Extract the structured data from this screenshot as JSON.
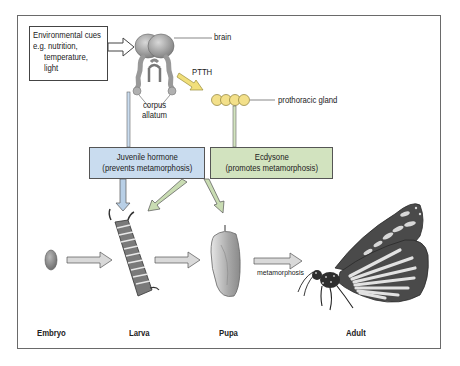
{
  "diagram": {
    "environment_box": {
      "lines": [
        "Environmental cues",
        "e.g. nutrition,",
        "temperature,",
        "light"
      ]
    },
    "labels": {
      "brain": "brain",
      "ptth": "PTTH",
      "prothoracic_gland": "prothoracic gland",
      "corpus_allatum_1": "corpus",
      "corpus_allatum_2": "allatum",
      "metamorphosis": "metamorphosis"
    },
    "hormones": {
      "juvenile": {
        "title": "Juvenile hormone",
        "subtitle": "(prevents metamorphosis)",
        "color": "#c9dcef"
      },
      "ecdysone": {
        "title": "Ecdysone",
        "subtitle": "(promotes metamorphosis)",
        "color": "#d2e3bf"
      }
    },
    "stages": [
      {
        "label": "Embryo"
      },
      {
        "label": "Larva"
      },
      {
        "label": "Pupa"
      },
      {
        "label": "Adult"
      }
    ],
    "colors": {
      "gland_fill": "#f3e08a",
      "ptth_arrow": "#f1df7a",
      "jh_arrow": "#b8cfe6",
      "ecd_arrow": "#c9dcb3",
      "stage_arrow": "#d9d9d9"
    }
  }
}
